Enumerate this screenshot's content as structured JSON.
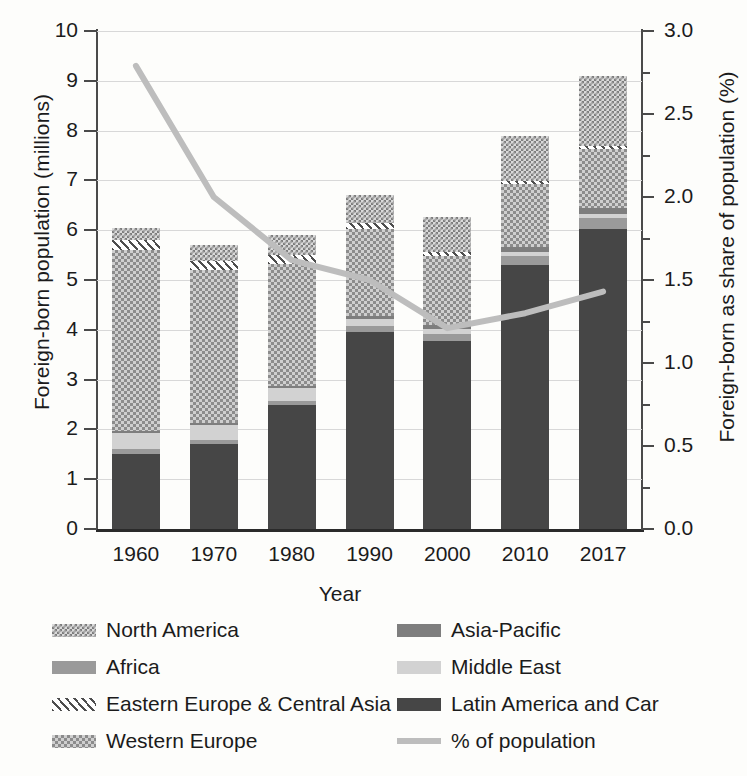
{
  "chart_data": {
    "type": "bar",
    "title": "",
    "xlabel": "Year",
    "ylabel": "Foreign-born population (millions)",
    "y2label": "Foreign-born as share of population (%)",
    "categories": [
      "1960",
      "1970",
      "1980",
      "1990",
      "2000",
      "2010",
      "2017"
    ],
    "ylim": [
      0,
      10
    ],
    "yticks": [
      "0",
      "1",
      "2",
      "3",
      "4",
      "5",
      "6",
      "7",
      "8",
      "9",
      "10"
    ],
    "y2lim": [
      0.0,
      3.0
    ],
    "y2ticks": [
      "0.0",
      "0.5",
      "1.0",
      "1.5",
      "2.0",
      "2.5",
      "3.0"
    ],
    "grid": true,
    "legend_position": "below",
    "stack_order_bottom_to_top": [
      "Latin America and Car",
      "Africa",
      "Middle East",
      "Asia-Pacific",
      "Western Europe",
      "Eastern Europe & Central Asia",
      "North America"
    ],
    "series": [
      {
        "name": "Latin America and Car",
        "values": [
          1.5,
          1.7,
          2.48,
          3.95,
          3.78,
          5.3,
          6.03
        ]
      },
      {
        "name": "Africa",
        "values": [
          0.1,
          0.08,
          0.1,
          0.12,
          0.14,
          0.18,
          0.22
        ]
      },
      {
        "name": "Middle East",
        "values": [
          0.33,
          0.3,
          0.25,
          0.14,
          0.1,
          0.08,
          0.07
        ]
      },
      {
        "name": "Asia-Pacific",
        "values": [
          0.04,
          0.04,
          0.05,
          0.07,
          0.08,
          0.1,
          0.12
        ]
      },
      {
        "name": "Western Europe",
        "values": [
          3.63,
          3.08,
          2.45,
          1.75,
          1.38,
          1.27,
          1.2
        ]
      },
      {
        "name": "Eastern Europe & Central Asia",
        "values": [
          0.2,
          0.18,
          0.17,
          0.12,
          0.08,
          0.06,
          0.05
        ]
      },
      {
        "name": "North America",
        "values": [
          0.25,
          0.32,
          0.4,
          0.55,
          0.7,
          0.91,
          1.41
        ]
      }
    ],
    "totals": [
      6.05,
      5.7,
      5.9,
      6.7,
      6.26,
      7.9,
      9.1
    ],
    "line_series": {
      "name": "% of population",
      "axis": "right",
      "values": [
        2.79,
        2.0,
        1.62,
        1.5,
        1.21,
        1.3,
        1.43
      ]
    }
  },
  "axes": {
    "left_title": "Foreign-born population (millions)",
    "right_title": "Foreign-born as share of population (%)",
    "bottom_title": "Year",
    "left_ticks": [
      "10",
      "9",
      "8",
      "7",
      "6",
      "5",
      "4",
      "3",
      "2",
      "1",
      "0"
    ],
    "right_ticks": [
      "3.0",
      "2.5",
      "2.0",
      "1.5",
      "1.0",
      "0.5",
      "0.0"
    ],
    "bottom_ticks": [
      "1960",
      "1970",
      "1980",
      "1990",
      "2000",
      "2010",
      "2017"
    ]
  },
  "legend": {
    "items": [
      {
        "label": "North America",
        "pattern": "checker",
        "color": "#7d7d7d"
      },
      {
        "label": "Asia-Pacific",
        "pattern": "solid",
        "color": "#7e7e7e"
      },
      {
        "label": "Africa",
        "pattern": "solid",
        "color": "#9a9a9a"
      },
      {
        "label": "Middle East",
        "pattern": "solid",
        "color": "#d2d2d2"
      },
      {
        "label": "Eastern Europe & Central Asia",
        "pattern": "diagonal",
        "color": "#4e4e4e"
      },
      {
        "label": "Latin America and Car",
        "pattern": "solid",
        "color": "#464646"
      },
      {
        "label": "Western Europe",
        "pattern": "crosshatch",
        "color": "#8c8c8c"
      },
      {
        "label": "% of population",
        "pattern": "line",
        "color": "#bdbdbd"
      }
    ]
  },
  "colors": {
    "line": "#bdbdbd",
    "grid": "#d8d8d8",
    "axis": "#3a3a3a",
    "background": "#fdfdfb"
  }
}
